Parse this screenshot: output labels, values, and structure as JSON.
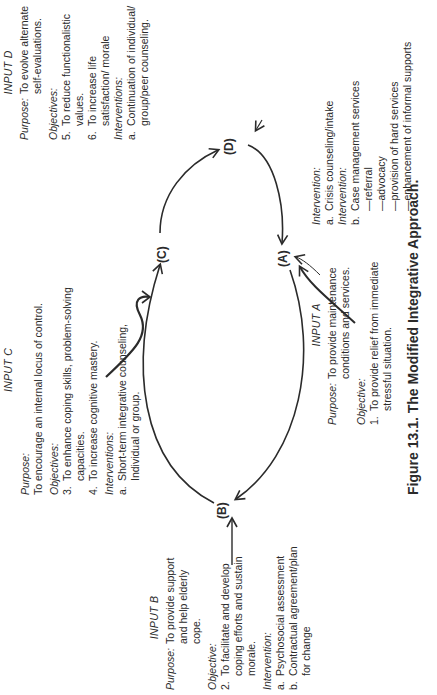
{
  "figure": {
    "caption": "Figure 13.1. The Modified Integrative Approach.",
    "orientation": "rotated 90° counterclockwise"
  },
  "nodes": {
    "A": "(A)",
    "B": "(B)",
    "C": "(C)",
    "D": "(D)"
  },
  "input_a": {
    "title": "INPUT A",
    "purpose_label": "Purpose:",
    "purpose": "To provide maintenance conditions and services.",
    "objective_label": "Objective:",
    "objectives": [
      {
        "num": "1.",
        "text": "To provide relief from immediate stressful situation."
      }
    ],
    "intervention_label_1": "Intervention:",
    "intervention_a": {
      "num": "a.",
      "text": "Crisis counseling/intake"
    },
    "intervention_label_2": "Intervention:",
    "intervention_b": {
      "num": "b.",
      "text": "Case management services"
    },
    "services": [
      "—referral",
      "—advocacy",
      "—provision of hard services",
      "—enhancement of informal supports"
    ]
  },
  "input_b": {
    "title": "INPUT B",
    "purpose_label": "Purpose:",
    "purpose": "To provide support and help elderly cope.",
    "objective_label": "Objective:",
    "objectives": [
      {
        "num": "2.",
        "text": "To facilitate and develop coping efforts and sustain morale."
      }
    ],
    "intervention_label": "Intervention:",
    "interventions": [
      {
        "num": "a.",
        "text": "Psychosocial assessment"
      },
      {
        "num": "b.",
        "text": "Contractual agreement/plan for change"
      }
    ]
  },
  "input_c": {
    "title": "INPUT C",
    "purpose_label": "Purpose:",
    "purpose": "To encourage an internal locus of control.",
    "objective_label": "Objectives:",
    "objectives": [
      {
        "num": "3.",
        "text": "To enhance coping skills, problem-solving capacities."
      },
      {
        "num": "4.",
        "text": "To increase cognitive mastery."
      }
    ],
    "intervention_label": "Interventions:",
    "interventions": [
      {
        "num": "a.",
        "text": "Short-term integrative counseling, Individual or group."
      }
    ]
  },
  "input_d": {
    "title": "INPUT D",
    "purpose_label": "Purpose:",
    "purpose": "To evolve alternate self-evaluations.",
    "objective_label": "Objectives:",
    "objectives": [
      {
        "num": "5.",
        "text": "To reduce functionalistic values."
      },
      {
        "num": "6.",
        "text": "To increase life satisfaction/ morale"
      }
    ],
    "intervention_label": "Interventions:",
    "interventions": [
      {
        "num": "a.",
        "text": "Continuation of individual/ group/peer counseling."
      }
    ]
  }
}
